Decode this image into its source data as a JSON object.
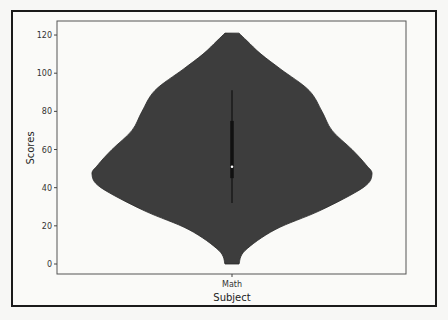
{
  "chart_data": {
    "type": "violin",
    "title": "",
    "xlabel": "Subject",
    "ylabel": "Scores",
    "categories": [
      "Math"
    ],
    "ylim": [
      -3,
      127
    ],
    "yticks": [
      0,
      20,
      40,
      60,
      80,
      100,
      120
    ],
    "grid": false,
    "series": [
      {
        "name": "Math",
        "min": 0,
        "max": 121,
        "whisker_low": 32,
        "q1": 45,
        "median": 51,
        "q3": 75,
        "whisker_high": 91,
        "density_profile": [
          {
            "y": 121,
            "half_width": 7
          },
          {
            "y": 117,
            "half_width": 15
          },
          {
            "y": 110,
            "half_width": 29
          },
          {
            "y": 102,
            "half_width": 49
          },
          {
            "y": 91,
            "half_width": 77
          },
          {
            "y": 80,
            "half_width": 90
          },
          {
            "y": 70,
            "half_width": 100
          },
          {
            "y": 60,
            "half_width": 120
          },
          {
            "y": 52,
            "half_width": 134
          },
          {
            "y": 47,
            "half_width": 140
          },
          {
            "y": 40,
            "half_width": 131
          },
          {
            "y": 28,
            "half_width": 88
          },
          {
            "y": 18,
            "half_width": 43
          },
          {
            "y": 7,
            "half_width": 13
          },
          {
            "y": 0,
            "half_width": 7
          }
        ]
      }
    ],
    "colors": {
      "violin_fill": "#3d3d3d",
      "box": "#111111",
      "median_dot": "#ffffff"
    }
  },
  "axes": {
    "xlabel": "Subject",
    "ylabel": "Scores",
    "xtick": "Math",
    "yticks": [
      "0",
      "20",
      "40",
      "60",
      "80",
      "100",
      "120"
    ]
  }
}
